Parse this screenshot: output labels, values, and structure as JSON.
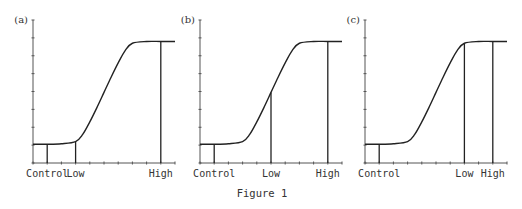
{
  "figure": {
    "caption": "Figure 1"
  },
  "chart_data": [
    {
      "type": "line",
      "panel_label": "(a)",
      "title": "",
      "xlabel": "",
      "ylabel": "",
      "xlim": [
        0,
        10
      ],
      "ylim": [
        0,
        8
      ],
      "x_tick_count": 11,
      "y_tick_count": 9,
      "grid": false,
      "curve": {
        "description": "sigmoid dose-response",
        "baseline": 1.05,
        "plateau": 6.8,
        "rise_start_x": 3,
        "midpoint_x": 5,
        "knee_x": 7,
        "points": [
          [
            0,
            1.05
          ],
          [
            1,
            1.05
          ],
          [
            2,
            1.08
          ],
          [
            3,
            1.2
          ],
          [
            3.5,
            1.6
          ],
          [
            4,
            2.3
          ],
          [
            4.5,
            3.1
          ],
          [
            5,
            3.95
          ],
          [
            5.5,
            4.8
          ],
          [
            6,
            5.6
          ],
          [
            6.5,
            6.3
          ],
          [
            7,
            6.7
          ],
          [
            8,
            6.8
          ],
          [
            9,
            6.8
          ],
          [
            10,
            6.8
          ]
        ]
      },
      "markers": [
        {
          "label": "Control",
          "x": 1
        },
        {
          "label": "Low",
          "x": 3
        },
        {
          "label": "High",
          "x": 9
        }
      ]
    },
    {
      "type": "line",
      "panel_label": "(b)",
      "title": "",
      "xlabel": "",
      "ylabel": "",
      "xlim": [
        0,
        10
      ],
      "ylim": [
        0,
        8
      ],
      "x_tick_count": 11,
      "y_tick_count": 9,
      "grid": false,
      "curve": {
        "description": "sigmoid dose-response",
        "baseline": 1.05,
        "plateau": 6.8,
        "rise_start_x": 3,
        "midpoint_x": 5,
        "knee_x": 7,
        "points": [
          [
            0,
            1.05
          ],
          [
            1,
            1.05
          ],
          [
            2,
            1.08
          ],
          [
            3,
            1.2
          ],
          [
            3.5,
            1.6
          ],
          [
            4,
            2.3
          ],
          [
            4.5,
            3.1
          ],
          [
            5,
            3.95
          ],
          [
            5.5,
            4.8
          ],
          [
            6,
            5.6
          ],
          [
            6.5,
            6.3
          ],
          [
            7,
            6.7
          ],
          [
            8,
            6.8
          ],
          [
            9,
            6.8
          ],
          [
            10,
            6.8
          ]
        ]
      },
      "markers": [
        {
          "label": "Control",
          "x": 1
        },
        {
          "label": "Low",
          "x": 5
        },
        {
          "label": "High",
          "x": 9
        }
      ]
    },
    {
      "type": "line",
      "panel_label": "(c)",
      "title": "",
      "xlabel": "",
      "ylabel": "",
      "xlim": [
        0,
        10
      ],
      "ylim": [
        0,
        8
      ],
      "x_tick_count": 11,
      "y_tick_count": 9,
      "grid": false,
      "curve": {
        "description": "sigmoid dose-response",
        "baseline": 1.05,
        "plateau": 6.8,
        "rise_start_x": 3,
        "midpoint_x": 5,
        "knee_x": 7,
        "points": [
          [
            0,
            1.05
          ],
          [
            1,
            1.05
          ],
          [
            2,
            1.08
          ],
          [
            3,
            1.2
          ],
          [
            3.5,
            1.6
          ],
          [
            4,
            2.3
          ],
          [
            4.5,
            3.1
          ],
          [
            5,
            3.95
          ],
          [
            5.5,
            4.8
          ],
          [
            6,
            5.6
          ],
          [
            6.5,
            6.3
          ],
          [
            7,
            6.7
          ],
          [
            8,
            6.8
          ],
          [
            9,
            6.8
          ],
          [
            10,
            6.8
          ]
        ]
      },
      "markers": [
        {
          "label": "Control",
          "x": 1
        },
        {
          "label": "Low",
          "x": 7
        },
        {
          "label": "High",
          "x": 9
        }
      ]
    }
  ]
}
